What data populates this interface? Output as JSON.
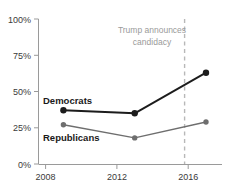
{
  "chart_data": {
    "type": "line",
    "title": "",
    "xlabel": "",
    "ylabel": "",
    "xlim": [
      2007.6,
      2017.9
    ],
    "ylim": [
      0,
      100
    ],
    "grid": false,
    "legend_position": "inline-labels",
    "x_tick_labels": [
      "2008",
      "2012",
      "2016"
    ],
    "x_ticks": [
      2008,
      2012,
      2016
    ],
    "y_tick_labels": [
      "0%",
      "25%",
      "50%",
      "75%",
      "100%"
    ],
    "y_ticks": [
      0,
      25,
      50,
      75,
      100
    ],
    "x": [
      2009,
      2013,
      2017
    ],
    "series": [
      {
        "name": "Democrats",
        "values": [
          37,
          35,
          63
        ],
        "color": "#1c1c1c"
      },
      {
        "name": "Republicans",
        "values": [
          27,
          18,
          29
        ],
        "color": "#6e6e6e"
      }
    ],
    "annotations": [
      {
        "name": "trump-announcement",
        "line1": "Trump announces",
        "line2": "candidacy",
        "x": 2015.8,
        "color": "#b8b8b8"
      }
    ]
  },
  "axis": {
    "y_labels": [
      "100%",
      "75%",
      "50%",
      "25%",
      "0%"
    ],
    "x_labels": [
      "2008",
      "2012",
      "2016"
    ]
  },
  "series_labels": {
    "democrats": "Democrats",
    "republicans": "Republicans"
  },
  "annotation": {
    "line1": "Trump announces",
    "line2": "candidacy"
  },
  "colors": {
    "democrats": "#1c1c1c",
    "republicans": "#6e6e6e",
    "axis": "#9a9a9a",
    "annotation": "#b8b8b8",
    "tick_text": "#3a3a3a"
  }
}
